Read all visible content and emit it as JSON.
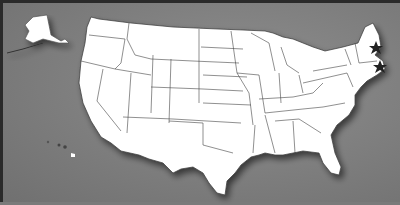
{
  "map": {
    "title": "",
    "background_color": "#7c7c7c",
    "land_color": "#ffffff",
    "border_color": "#333333",
    "regions": [
      "contiguous-us",
      "alaska",
      "hawaii"
    ],
    "markers": [
      {
        "name": "star-marker-maine-nh",
        "x": 373,
        "y": 45
      },
      {
        "name": "star-marker-massachusetts",
        "x": 377,
        "y": 64
      }
    ],
    "marker_color": "#222222"
  }
}
